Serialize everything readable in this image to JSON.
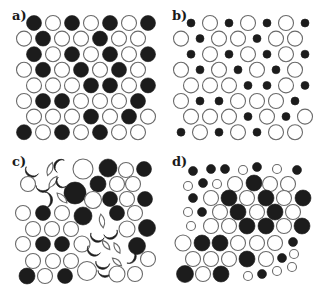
{
  "figure": {
    "colors": {
      "filled": "#1c1c1c",
      "open_stroke": "#6a6a6a",
      "background": "#ffffff"
    },
    "panels": [
      {
        "id": "a",
        "label": "a)",
        "label_pos": [
          12,
          20
        ],
        "grid": {
          "x0_even": 34,
          "x0_odd": 24,
          "dx": 19,
          "y0": 23,
          "dy": 15.6,
          "r": 7.5
        },
        "rows": [
          "F O F O F O F",
          "O F O O F O O",
          "F O F O F O F",
          "O F O F O F O",
          "O O O F F O F",
          "O F F O O O F",
          "O O O F O F O",
          "F O F O F O O"
        ]
      },
      {
        "id": "b",
        "label": "b)",
        "label_pos": [
          172,
          20
        ],
        "grid": {
          "x0_even": 191,
          "x0_odd": 181,
          "dx": 19,
          "y0": 23,
          "dy": 15.6,
          "r": 7.5,
          "small_r": 4
        },
        "rows": [
          "s O s O s O s",
          "O s O O s O O",
          "s O s O s O s",
          "O s O s O s O",
          "O O O s s O s",
          "O s s O O O s",
          "O O O s O s O",
          "s O s O s O O"
        ]
      },
      {
        "id": "c",
        "label": "c)",
        "label_pos": [
          12,
          166
        ],
        "items": [
          {
            "t": "crescent",
            "x": 33,
            "y": 169,
            "r": 7,
            "rot": -60,
            "fill": true
          },
          {
            "t": "lens",
            "x": 50,
            "y": 169,
            "r": 7,
            "rot": 20
          },
          {
            "t": "crescent",
            "x": 62,
            "y": 167,
            "r": 7,
            "rot": 30,
            "fill": true
          },
          {
            "t": "circle",
            "x": 83,
            "y": 169,
            "r": 10,
            "fill": false
          },
          {
            "t": "circle",
            "x": 108,
            "y": 168,
            "r": 9,
            "fill": true
          },
          {
            "t": "circle",
            "x": 126,
            "y": 170,
            "r": 7.5,
            "fill": false
          },
          {
            "t": "circle",
            "x": 144,
            "y": 169,
            "r": 7.5,
            "fill": true
          },
          {
            "t": "circle",
            "x": 28,
            "y": 184,
            "r": 7.5,
            "fill": false
          },
          {
            "t": "crescent",
            "x": 43,
            "y": 184,
            "r": 7,
            "rot": -90,
            "fill": true
          },
          {
            "t": "lens",
            "x": 53,
            "y": 182,
            "r": 7,
            "rot": 35
          },
          {
            "t": "crescent",
            "x": 63,
            "y": 181,
            "r": 6,
            "rot": -40,
            "fill": true
          },
          {
            "t": "circle",
            "x": 75,
            "y": 193,
            "r": 11,
            "fill": true
          },
          {
            "t": "circle",
            "x": 98,
            "y": 184,
            "r": 8,
            "fill": true
          },
          {
            "t": "circle",
            "x": 117,
            "y": 184,
            "r": 7.5,
            "fill": false
          },
          {
            "t": "circle",
            "x": 133,
            "y": 184,
            "r": 7.5,
            "fill": false
          },
          {
            "t": "crescent",
            "x": 43,
            "y": 200,
            "r": 8,
            "rot": 180,
            "fill": true
          },
          {
            "t": "lens",
            "x": 62,
            "y": 198,
            "r": 7,
            "rot": -45
          },
          {
            "t": "circle",
            "x": 93,
            "y": 200,
            "r": 8.5,
            "fill": false
          },
          {
            "t": "circle",
            "x": 110,
            "y": 199,
            "r": 7.5,
            "fill": true
          },
          {
            "t": "circle",
            "x": 127,
            "y": 199,
            "r": 7.5,
            "fill": false
          },
          {
            "t": "circle",
            "x": 145,
            "y": 199,
            "r": 7.5,
            "fill": true
          },
          {
            "t": "circle",
            "x": 23,
            "y": 213,
            "r": 7.5,
            "fill": false
          },
          {
            "t": "circle",
            "x": 43,
            "y": 213,
            "r": 7.5,
            "fill": true
          },
          {
            "t": "circle",
            "x": 62,
            "y": 213,
            "r": 7.5,
            "fill": false
          },
          {
            "t": "circle",
            "x": 83,
            "y": 216,
            "r": 9,
            "fill": true
          },
          {
            "t": "lens",
            "x": 102,
            "y": 221,
            "r": 7,
            "rot": -10
          },
          {
            "t": "circle",
            "x": 117,
            "y": 213,
            "r": 7.5,
            "fill": true
          },
          {
            "t": "circle",
            "x": 135,
            "y": 213,
            "r": 7.5,
            "fill": false
          },
          {
            "t": "circle",
            "x": 33,
            "y": 229,
            "r": 7.5,
            "fill": false
          },
          {
            "t": "circle",
            "x": 52,
            "y": 229,
            "r": 7.5,
            "fill": false
          },
          {
            "t": "circle",
            "x": 71,
            "y": 229,
            "r": 7.5,
            "fill": false
          },
          {
            "t": "crescent",
            "x": 98,
            "y": 234,
            "r": 7,
            "rot": -70,
            "fill": true
          },
          {
            "t": "crescent",
            "x": 110,
            "y": 231,
            "r": 7,
            "rot": -110,
            "fill": true
          },
          {
            "t": "circle",
            "x": 127,
            "y": 229,
            "r": 8,
            "fill": false
          },
          {
            "t": "circle",
            "x": 147,
            "y": 228,
            "r": 8.5,
            "fill": true
          },
          {
            "t": "circle",
            "x": 23,
            "y": 244,
            "r": 7.5,
            "fill": false
          },
          {
            "t": "circle",
            "x": 43,
            "y": 244,
            "r": 7.5,
            "fill": true
          },
          {
            "t": "circle",
            "x": 62,
            "y": 244,
            "r": 7.5,
            "fill": true
          },
          {
            "t": "circle",
            "x": 82,
            "y": 244,
            "r": 8,
            "fill": false
          },
          {
            "t": "crescent",
            "x": 95,
            "y": 248,
            "r": 7,
            "rot": -60,
            "fill": true
          },
          {
            "t": "lens",
            "x": 106,
            "y": 245,
            "r": 6,
            "rot": -40
          },
          {
            "t": "lens",
            "x": 117,
            "y": 248,
            "r": 6,
            "rot": -30
          },
          {
            "t": "circle",
            "x": 137,
            "y": 246,
            "r": 8.5,
            "fill": true
          },
          {
            "t": "circle",
            "x": 33,
            "y": 261,
            "r": 7.5,
            "fill": false
          },
          {
            "t": "circle",
            "x": 53,
            "y": 261,
            "r": 7.5,
            "fill": false
          },
          {
            "t": "circle",
            "x": 71,
            "y": 261,
            "r": 7.5,
            "fill": false
          },
          {
            "t": "crescent",
            "x": 103,
            "y": 261,
            "r": 7,
            "rot": -80,
            "fill": true
          },
          {
            "t": "lens",
            "x": 117,
            "y": 262,
            "r": 6,
            "rot": -50
          },
          {
            "t": "crescent",
            "x": 128,
            "y": 256,
            "r": 7,
            "rot": 200,
            "fill": true
          },
          {
            "t": "circle",
            "x": 148,
            "y": 259,
            "r": 7.5,
            "fill": false
          },
          {
            "t": "circle",
            "x": 27,
            "y": 276,
            "r": 8,
            "fill": true
          },
          {
            "t": "circle",
            "x": 45,
            "y": 276,
            "r": 7.5,
            "fill": false
          },
          {
            "t": "circle",
            "x": 65,
            "y": 276,
            "r": 7.5,
            "fill": true
          },
          {
            "t": "circle",
            "x": 87,
            "y": 271,
            "r": 9.5,
            "fill": false
          },
          {
            "t": "crescent",
            "x": 105,
            "y": 269,
            "r": 7,
            "rot": -90,
            "fill": true
          },
          {
            "t": "circle",
            "x": 117,
            "y": 274,
            "r": 8,
            "fill": false
          },
          {
            "t": "circle",
            "x": 135,
            "y": 274,
            "r": 7.5,
            "fill": false
          }
        ]
      },
      {
        "id": "d",
        "label": "d)",
        "label_pos": [
          172,
          166
        ],
        "items": [
          {
            "x": 193,
            "y": 171,
            "r": 4.5,
            "fill": true
          },
          {
            "x": 211,
            "y": 169,
            "r": 4.5,
            "fill": true
          },
          {
            "x": 225,
            "y": 169,
            "r": 4.5,
            "fill": true
          },
          {
            "x": 243,
            "y": 170,
            "r": 4.5,
            "fill": false
          },
          {
            "x": 257,
            "y": 167,
            "r": 4.5,
            "fill": true
          },
          {
            "x": 277,
            "y": 169,
            "r": 4.5,
            "fill": false
          },
          {
            "x": 297,
            "y": 170,
            "r": 4.5,
            "fill": true
          },
          {
            "x": 188,
            "y": 186,
            "r": 4.5,
            "fill": false
          },
          {
            "x": 203,
            "y": 183,
            "r": 4.5,
            "fill": true
          },
          {
            "x": 217,
            "y": 184,
            "r": 4.5,
            "fill": false
          },
          {
            "x": 235,
            "y": 184,
            "r": 7.5,
            "fill": false
          },
          {
            "x": 254,
            "y": 183,
            "r": 8,
            "fill": true
          },
          {
            "x": 270,
            "y": 184,
            "r": 7.5,
            "fill": false
          },
          {
            "x": 288,
            "y": 184,
            "r": 7.5,
            "fill": false
          },
          {
            "x": 193,
            "y": 198,
            "r": 4.5,
            "fill": true
          },
          {
            "x": 211,
            "y": 198,
            "r": 7.5,
            "fill": false
          },
          {
            "x": 229,
            "y": 198,
            "r": 8,
            "fill": true
          },
          {
            "x": 247,
            "y": 198,
            "r": 7.5,
            "fill": false
          },
          {
            "x": 266,
            "y": 198,
            "r": 8,
            "fill": true
          },
          {
            "x": 284,
            "y": 198,
            "r": 7.5,
            "fill": false
          },
          {
            "x": 303,
            "y": 198,
            "r": 8,
            "fill": true
          },
          {
            "x": 188,
            "y": 212,
            "r": 4.5,
            "fill": false
          },
          {
            "x": 202,
            "y": 212,
            "r": 4.5,
            "fill": true
          },
          {
            "x": 220,
            "y": 212,
            "r": 7.5,
            "fill": false
          },
          {
            "x": 238,
            "y": 212,
            "r": 8,
            "fill": true
          },
          {
            "x": 257,
            "y": 212,
            "r": 7.5,
            "fill": false
          },
          {
            "x": 275,
            "y": 212,
            "r": 8,
            "fill": true
          },
          {
            "x": 293,
            "y": 212,
            "r": 7.5,
            "fill": false
          },
          {
            "x": 191,
            "y": 226,
            "r": 4.5,
            "fill": false
          },
          {
            "x": 211,
            "y": 226,
            "r": 7.5,
            "fill": false
          },
          {
            "x": 229,
            "y": 226,
            "r": 7.5,
            "fill": false
          },
          {
            "x": 247,
            "y": 226,
            "r": 8,
            "fill": true
          },
          {
            "x": 266,
            "y": 226,
            "r": 8,
            "fill": true
          },
          {
            "x": 284,
            "y": 226,
            "r": 7.5,
            "fill": false
          },
          {
            "x": 302,
            "y": 226,
            "r": 8,
            "fill": true
          },
          {
            "x": 183,
            "y": 243,
            "r": 8,
            "fill": false
          },
          {
            "x": 202,
            "y": 243,
            "r": 8,
            "fill": true
          },
          {
            "x": 220,
            "y": 243,
            "r": 8,
            "fill": true
          },
          {
            "x": 238,
            "y": 243,
            "r": 7.5,
            "fill": false
          },
          {
            "x": 257,
            "y": 243,
            "r": 7.5,
            "fill": false
          },
          {
            "x": 275,
            "y": 243,
            "r": 7.5,
            "fill": false
          },
          {
            "x": 293,
            "y": 242,
            "r": 4.5,
            "fill": true
          },
          {
            "x": 193,
            "y": 259,
            "r": 7.5,
            "fill": false
          },
          {
            "x": 211,
            "y": 259,
            "r": 7.5,
            "fill": false
          },
          {
            "x": 229,
            "y": 259,
            "r": 7.5,
            "fill": false
          },
          {
            "x": 247,
            "y": 259,
            "r": 8,
            "fill": true
          },
          {
            "x": 266,
            "y": 259,
            "r": 7.5,
            "fill": false
          },
          {
            "x": 282,
            "y": 258,
            "r": 4.5,
            "fill": true
          },
          {
            "x": 294,
            "y": 254,
            "r": 4.5,
            "fill": false
          },
          {
            "x": 185,
            "y": 274,
            "r": 8.5,
            "fill": true
          },
          {
            "x": 203,
            "y": 274,
            "r": 7.5,
            "fill": false
          },
          {
            "x": 221,
            "y": 274,
            "r": 8,
            "fill": true
          },
          {
            "x": 248,
            "y": 276,
            "r": 4.5,
            "fill": false
          },
          {
            "x": 262,
            "y": 274,
            "r": 4.5,
            "fill": true
          },
          {
            "x": 277,
            "y": 271,
            "r": 4.5,
            "fill": false
          },
          {
            "x": 292,
            "y": 267,
            "r": 4.5,
            "fill": false
          }
        ]
      }
    ]
  }
}
